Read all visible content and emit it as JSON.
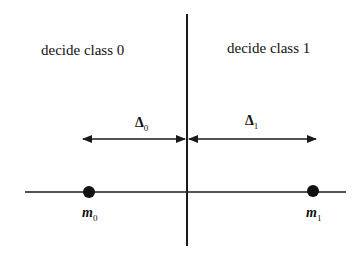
{
  "diagram": {
    "regions": {
      "left_label": "decide class 0",
      "right_label": "decide class 1"
    },
    "distances": {
      "left": {
        "symbol": "Δ",
        "subscript": "0"
      },
      "right": {
        "symbol": "Δ",
        "subscript": "1"
      }
    },
    "means": {
      "left": {
        "symbol": "m",
        "subscript": "0"
      },
      "right": {
        "symbol": "m",
        "subscript": "1"
      }
    },
    "colors": {
      "line": "#1a1a1a",
      "background": "#ffffff"
    }
  }
}
